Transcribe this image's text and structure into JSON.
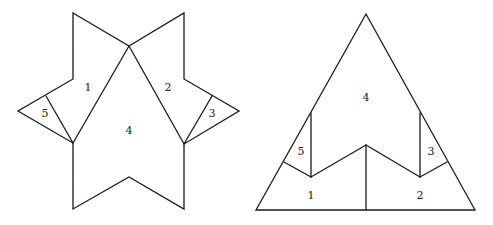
{
  "diagram": {
    "stroke_color": "#1a1a1a",
    "background": "#ffffff",
    "left_figure": {
      "name": "star",
      "outline": [
        [
          73,
          13
        ],
        [
          129,
          46
        ],
        [
          184,
          13
        ],
        [
          184,
          79
        ],
        [
          239,
          111
        ],
        [
          184,
          144
        ],
        [
          184,
          209
        ],
        [
          129,
          177
        ],
        [
          73,
          209
        ],
        [
          73,
          143
        ],
        [
          18,
          111
        ],
        [
          73,
          79
        ]
      ],
      "cuts": [
        [
          [
            129,
            46
          ],
          [
            73,
            143
          ]
        ],
        [
          [
            129,
            46
          ],
          [
            184,
            144
          ]
        ],
        [
          [
            46,
            96
          ],
          [
            73,
            143
          ]
        ],
        [
          [
            212,
            96
          ],
          [
            184,
            144
          ]
        ]
      ],
      "labels": [
        {
          "text": "1",
          "x": 88,
          "y": 88
        },
        {
          "text": "2",
          "x": 168,
          "y": 88
        },
        {
          "text": "3",
          "x": 212,
          "y": 114
        },
        {
          "text": "4",
          "x": 129,
          "y": 131
        },
        {
          "text": "5",
          "x": 45,
          "y": 114
        }
      ]
    },
    "right_figure": {
      "name": "triangle",
      "outline": [
        [
          366,
          14
        ],
        [
          475,
          210
        ],
        [
          256,
          210
        ]
      ],
      "cuts": [
        [
          [
            311,
            113
          ],
          [
            311,
            177
          ]
        ],
        [
          [
            284,
            162
          ],
          [
            311,
            177
          ]
        ],
        [
          [
            311,
            177
          ],
          [
            366,
            145
          ]
        ],
        [
          [
            366,
            145
          ],
          [
            420,
            177
          ]
        ],
        [
          [
            420,
            177
          ],
          [
            447,
            162
          ]
        ],
        [
          [
            420,
            113
          ],
          [
            420,
            177
          ]
        ],
        [
          [
            366,
            145
          ],
          [
            366,
            210
          ]
        ]
      ],
      "labels": [
        {
          "text": "4",
          "x": 366,
          "y": 98
        },
        {
          "text": "5",
          "x": 301,
          "y": 152
        },
        {
          "text": "3",
          "x": 431,
          "y": 152
        },
        {
          "text": "1",
          "x": 311,
          "y": 196
        },
        {
          "text": "2",
          "x": 420,
          "y": 196
        }
      ]
    }
  }
}
